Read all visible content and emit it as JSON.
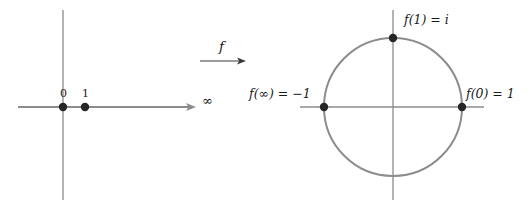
{
  "figure": {
    "domain_axis": {
      "points": [
        {
          "id": "zero",
          "label": "0",
          "cx": 63,
          "cy": 107
        },
        {
          "id": "one",
          "label": "1",
          "cx": 85,
          "cy": 107
        }
      ],
      "infinity_label": "∞",
      "horizontal_axis": {
        "x1": 18,
        "x2": 196,
        "y": 107,
        "arrow": "right"
      },
      "vertical_axis": {
        "x": 63,
        "y1": 10,
        "y2": 200
      }
    },
    "mapping": {
      "label": "f",
      "arrow": {
        "x1": 200,
        "x2": 246,
        "y": 61,
        "arrow": "right"
      }
    },
    "codomain_circle": {
      "center": {
        "cx": 393,
        "cy": 107
      },
      "radius": 69,
      "horizontal_axis": {
        "x1": 300,
        "x2": 484,
        "y": 107
      },
      "vertical_axis": {
        "x": 393,
        "y1": 10,
        "y2": 200
      },
      "points": [
        {
          "id": "top",
          "label": "f(1) = i",
          "cx": 393,
          "cy": 38
        },
        {
          "id": "left",
          "label": "f(∞) = −1",
          "cx": 324,
          "cy": 107
        },
        {
          "id": "right",
          "label": "f(0) = 1",
          "cx": 462,
          "cy": 107
        }
      ]
    },
    "colors": {
      "axis": "#8c8c8c",
      "circle": "#8c8c8c",
      "point": "#262626",
      "text": "#1a1a1a",
      "background": "#ffffff"
    }
  }
}
